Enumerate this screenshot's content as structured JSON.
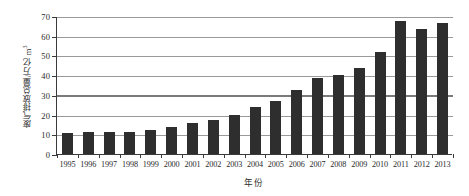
{
  "chart_data": {
    "type": "bar",
    "title": "",
    "xlabel": "年份",
    "ylabel": "废气排放总量/万亿 m³",
    "ylabel_main": "废气排放总量/万亿 m",
    "ylabel_sup": "3",
    "categories": [
      "1995",
      "1996",
      "1997",
      "1998",
      "1999",
      "2000",
      "2001",
      "2002",
      "2003",
      "2004",
      "2005",
      "2006",
      "2007",
      "2008",
      "2009",
      "2010",
      "2011",
      "2012",
      "2013"
    ],
    "values": [
      10.5,
      11.1,
      11.3,
      11.1,
      12.4,
      13.8,
      15.8,
      17.5,
      19.8,
      23.7,
      26.9,
      32.5,
      38.8,
      40.3,
      43.8,
      51.9,
      67.5,
      63.5,
      66.7
    ],
    "ylim": [
      0,
      70
    ],
    "ytick_labels": [
      "0",
      "10",
      "20",
      "30",
      "40",
      "50",
      "60",
      "70"
    ],
    "ytick_values": [
      0,
      10,
      20,
      30,
      40,
      50,
      60,
      70
    ],
    "grid": true,
    "legend": "none",
    "reference_line_value": 30,
    "bar_color": "#2e2e2e",
    "grid_color": "#9a9a9a",
    "axis_color": "#3a3a3a"
  }
}
